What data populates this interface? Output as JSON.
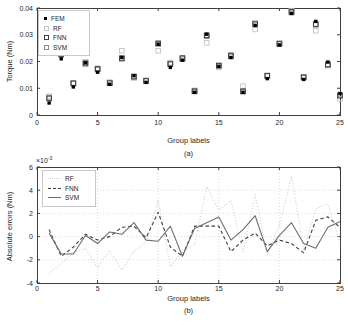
{
  "figure": {
    "background": "#ffffff",
    "axis_color": "#3f3f3f",
    "tick_label_color": "#262626",
    "grid_color": "#dcdcdc"
  },
  "chart_data": [
    {
      "id": "a",
      "type": "scatter",
      "title": "",
      "xlabel": "Group labels",
      "ylabel": "Torque (Nm)",
      "sublabel": "(a)",
      "xlim": [
        0,
        25
      ],
      "ylim": [
        0,
        0.04
      ],
      "xticks": [
        0,
        5,
        10,
        15,
        20,
        25
      ],
      "xtick_labels": [
        "0",
        "5",
        "10",
        "15",
        "20",
        "25"
      ],
      "yticks": [
        0,
        0.01,
        0.02,
        0.03,
        0.04
      ],
      "ytick_labels": [
        "0",
        "0.01",
        "0.02",
        "0.03",
        "0.04"
      ],
      "grid": false,
      "legend_position": "top-left",
      "x": [
        1,
        2,
        3,
        4,
        5,
        6,
        7,
        8,
        9,
        10,
        11,
        12,
        13,
        14,
        15,
        16,
        17,
        18,
        19,
        20,
        21,
        22,
        23,
        24,
        25
      ],
      "series": [
        {
          "name": "FEM",
          "marker": "filled-square",
          "color": "#000000",
          "values": [
            0.0045,
            0.021,
            0.0105,
            0.0195,
            0.016,
            0.0115,
            0.0215,
            0.0147,
            0.0122,
            0.0265,
            0.0178,
            0.0205,
            0.0085,
            0.0302,
            0.0182,
            0.0215,
            0.0085,
            0.0335,
            0.0136,
            0.0262,
            0.038,
            0.0133,
            0.035,
            0.0198,
            0.008
          ],
          "legend_label": "FEM"
        },
        {
          "name": "RF",
          "marker": "open-square",
          "color": "#c8c8c8",
          "values": [
            0.007,
            0.023,
            0.012,
            0.0198,
            0.0175,
            0.0122,
            0.024,
            0.0138,
            0.013,
            0.024,
            0.0196,
            0.021,
            0.0092,
            0.027,
            0.0178,
            0.0225,
            0.0108,
            0.032,
            0.0148,
            0.0268,
            0.039,
            0.0143,
            0.0315,
            0.0184,
            0.006
          ],
          "legend_label": "RF"
        },
        {
          "name": "FNN",
          "marker": "open-square",
          "color": "#3f3f3f",
          "values": [
            0.0062,
            0.0228,
            0.0118,
            0.0192,
            0.0172,
            0.0119,
            0.0211,
            0.0143,
            0.0127,
            0.0268,
            0.019,
            0.0213,
            0.0089,
            0.0298,
            0.0185,
            0.0222,
            0.0089,
            0.0342,
            0.0146,
            0.0267,
            0.0386,
            0.0141,
            0.034,
            0.0188,
            0.0072
          ],
          "legend_label": "FNN"
        },
        {
          "name": "SVM",
          "marker": "open-square",
          "color": "#8a8a8a",
          "values": [
            0.0065,
            0.0225,
            0.0119,
            0.0196,
            0.017,
            0.0121,
            0.0213,
            0.0144,
            0.0128,
            0.0266,
            0.0192,
            0.0209,
            0.0088,
            0.0295,
            0.0184,
            0.0219,
            0.0087,
            0.0338,
            0.0147,
            0.0265,
            0.0383,
            0.014,
            0.0337,
            0.019,
            0.0075
          ],
          "legend_label": "SVM"
        }
      ]
    },
    {
      "id": "b",
      "type": "line",
      "title": "",
      "xlabel": "Group labels",
      "ylabel": "Absolute errors (Nm)",
      "sublabel": "(b)",
      "y_multiplier_base": "×10",
      "y_multiplier_exp": "-3",
      "xlim": [
        0,
        25
      ],
      "ylim_e3": [
        -4,
        6
      ],
      "xticks": [
        0,
        5,
        10,
        15,
        20,
        25
      ],
      "xtick_labels": [
        "0",
        "5",
        "10",
        "15",
        "20",
        "25"
      ],
      "yticks_e3": [
        -4,
        -2,
        0,
        2,
        4,
        6
      ],
      "ytick_labels": [
        "-4",
        "-2",
        "0",
        "2",
        "4",
        "6"
      ],
      "grid": true,
      "legend_position": "top-left",
      "x": [
        1,
        2,
        3,
        4,
        5,
        6,
        7,
        8,
        9,
        10,
        11,
        12,
        13,
        14,
        15,
        16,
        17,
        18,
        19,
        20,
        21,
        22,
        23,
        24,
        25
      ],
      "series": [
        {
          "name": "RF",
          "style": "dotted",
          "color": "#cdcdcd",
          "values_e3": [
            -3.2,
            -2.3,
            -1.4,
            -1.0,
            -2.7,
            -1.2,
            -2.9,
            -1.3,
            -0.4,
            3.1,
            -2.6,
            -1.3,
            -0.7,
            4.3,
            2.3,
            3.1,
            -1.3,
            3.6,
            -1.6,
            1.0,
            5.2,
            -1.1,
            2.4,
            2.8,
            -0.5
          ],
          "legend_label": "RF"
        },
        {
          "name": "FNN",
          "style": "dashed",
          "color": "#3f3f3f",
          "values_e3": [
            0.6,
            -1.7,
            -0.9,
            0.2,
            -0.3,
            0.0,
            0.8,
            0.9,
            -0.1,
            2.1,
            -0.9,
            -1.7,
            0.9,
            0.9,
            0.9,
            -1.3,
            -0.3,
            0.3,
            -0.8,
            -0.3,
            -0.6,
            -1.4,
            1.4,
            1.7,
            0.8
          ],
          "legend_label": "FNN"
        },
        {
          "name": "SVM",
          "style": "solid",
          "color": "#6e6e6e",
          "values_e3": [
            0.3,
            -1.5,
            -1.5,
            0.1,
            -0.6,
            0.4,
            0.2,
            1.2,
            -0.3,
            -0.4,
            0.9,
            -1.7,
            0.7,
            1.2,
            1.7,
            -0.3,
            0.6,
            1.8,
            -1.3,
            0.1,
            1.2,
            -0.6,
            -1.0,
            0.8,
            1.3
          ],
          "legend_label": "SVM"
        }
      ]
    }
  ]
}
